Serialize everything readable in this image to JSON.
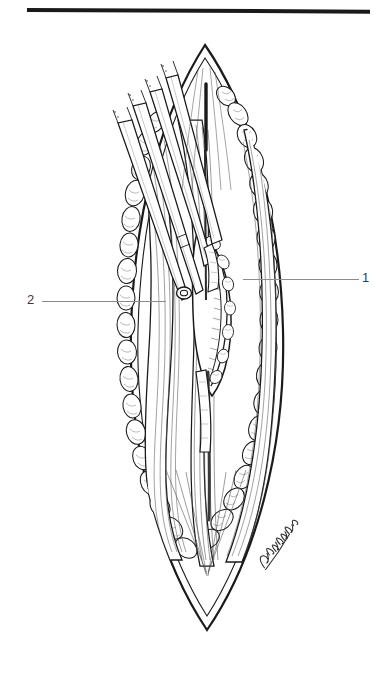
{
  "figure": {
    "name": "surgical-incision-illustration",
    "type": "pen-and-ink medical illustration",
    "background_color": "#ffffff",
    "ink_color": "#1a1a1a",
    "shading_color": "#555555"
  },
  "top_rule": {
    "name": "horizontal-rule",
    "color": "#1a1a1a",
    "thickness_px": 4
  },
  "callouts": [
    {
      "number": "1",
      "side": "right",
      "leader_color": "#8c8c8c",
      "target": "deep structure at right margin of wound"
    },
    {
      "number": "2",
      "side": "left",
      "leader_color": "#8c8c8c",
      "target": "retractor blade / tissue plane at left of wound"
    }
  ],
  "signature": {
    "name": "artist-signature",
    "text": "R.Wilmer",
    "position": "lower-right of illustration",
    "color": "#2a2a2a"
  },
  "instruments": {
    "name": "retractor-shafts",
    "count": 4,
    "entry": "upper-left, diagonal"
  }
}
